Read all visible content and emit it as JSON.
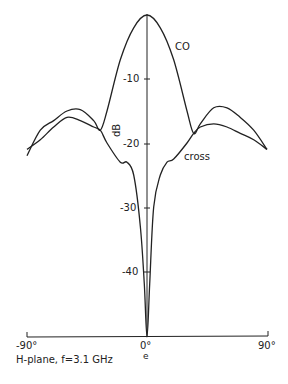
{
  "chart_data": {
    "type": "line",
    "title": "",
    "caption": "H-plane, f=3.1 GHz",
    "xlabel": "e",
    "ylabel": "dB",
    "xlim": [
      -90,
      90
    ],
    "ylim": [
      -50,
      0
    ],
    "x_ticks": [
      "-90°",
      "0°",
      "90°"
    ],
    "y_ticks": [
      "-10",
      "-20",
      "-30",
      "-40"
    ],
    "grid": false,
    "series": [
      {
        "name": "CO",
        "x": [
          -90,
          -80,
          -70,
          -60,
          -50,
          -40,
          -35,
          -30,
          -20,
          -10,
          0,
          10,
          20,
          30,
          35,
          40,
          50,
          60,
          70,
          80,
          90
        ],
        "y": [
          -22,
          -18,
          -16.5,
          -15,
          -14.8,
          -16.5,
          -18,
          -15,
          -7,
          -2,
          0,
          -2,
          -7,
          -15,
          -18.5,
          -17,
          -14.5,
          -14.5,
          -16,
          -18,
          -21
        ]
      },
      {
        "name": "cross",
        "x": [
          -90,
          -80,
          -70,
          -60,
          -50,
          -40,
          -35,
          -30,
          -20,
          -15,
          -10,
          -5,
          -2,
          0,
          2,
          5,
          10,
          15,
          20,
          30,
          35,
          40,
          50,
          60,
          70,
          80,
          90
        ],
        "y": [
          -21,
          -19.5,
          -17.5,
          -16,
          -16.5,
          -17.5,
          -18,
          -20,
          -23,
          -23,
          -25,
          -33,
          -42,
          -52,
          -42,
          -30,
          -25,
          -23,
          -22.5,
          -20,
          -18.5,
          -17.5,
          -17,
          -17.5,
          -18.5,
          -19.5,
          -21
        ]
      }
    ],
    "annotations": [
      {
        "text": "CO",
        "x": 25,
        "y": -6
      },
      {
        "text": "cross",
        "x": 25,
        "y": -24
      }
    ]
  },
  "labels": {
    "co": "CO",
    "cross": "cross",
    "db": "dB",
    "y10": "-10",
    "y20": "-20",
    "y30": "-30",
    "y40": "-40",
    "xm90": "-90°",
    "x0": "0°",
    "x90": "90°",
    "xunit": "e",
    "caption": "H-plane, f=3.1 GHz"
  }
}
